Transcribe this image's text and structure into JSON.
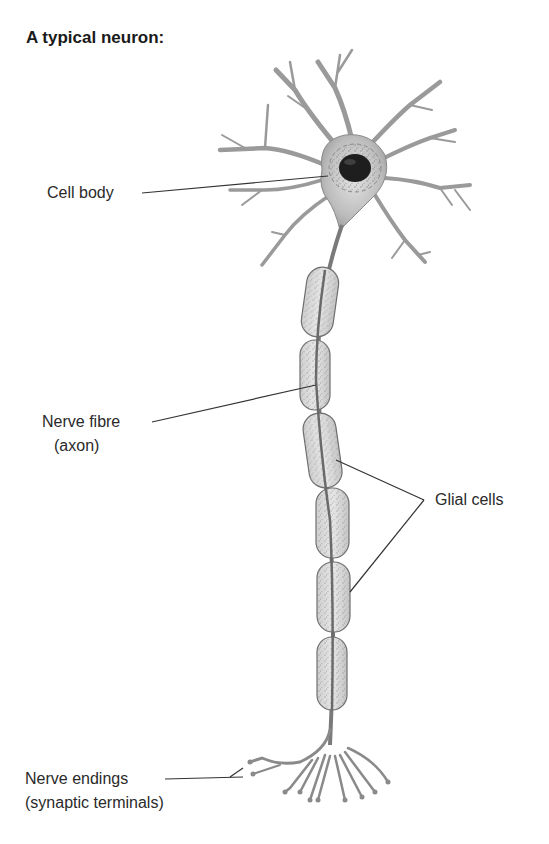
{
  "title": "A typical neuron:",
  "labels": {
    "cell_body": "Cell body",
    "nerve_fibre_line1": "Nerve fibre",
    "nerve_fibre_line2": "(axon)",
    "glial_cells": "Glial cells",
    "nerve_endings_line1": "Nerve endings",
    "nerve_endings_line2": "(synaptic terminals)"
  },
  "structure": {
    "glial_cell_count": 6,
    "parts": [
      "dendrites",
      "cell body",
      "nucleus",
      "axon",
      "glial cells",
      "synaptic terminals"
    ]
  },
  "colors": {
    "background": "#ffffff",
    "text": "#2a2a2a",
    "tissue_fill": "#c8c8c8",
    "tissue_stroke": "#777777",
    "nucleus": "#1e1e1e",
    "leader_line": "#333333"
  }
}
